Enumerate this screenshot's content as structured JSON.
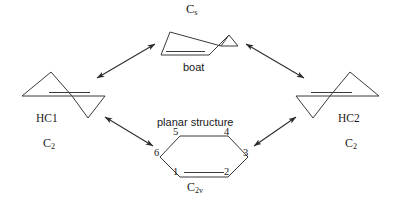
{
  "diagram": {
    "title_present": false,
    "background_color": "#ffffff",
    "line_color": "#3a3a3a",
    "arrow_color": "#2b2b2b",
    "text_color": "#1a1a1a"
  },
  "structures": {
    "top": {
      "point_group": "C",
      "point_group_sub": "s",
      "name": "boat",
      "icon": "boat-conformer-icon"
    },
    "left": {
      "name": "HC1",
      "point_group": "C",
      "point_group_sub": "2",
      "icon": "half-chair-1-icon"
    },
    "right": {
      "name": "HC2",
      "point_group": "C",
      "point_group_sub": "2",
      "icon": "half-chair-2-icon"
    },
    "bottom": {
      "name": "planar structure",
      "point_group": "C",
      "point_group_sub": "2v",
      "icon": "planar-ring-icon",
      "ring_numbers": [
        "1",
        "2",
        "3",
        "4",
        "5",
        "6"
      ]
    }
  },
  "arrows": [
    {
      "name": "arrow-boat-hc1",
      "style": "double-headed"
    },
    {
      "name": "arrow-boat-hc2",
      "style": "double-headed"
    },
    {
      "name": "arrow-hc1-planar",
      "style": "double-headed"
    },
    {
      "name": "arrow-hc2-planar",
      "style": "double-headed"
    }
  ]
}
